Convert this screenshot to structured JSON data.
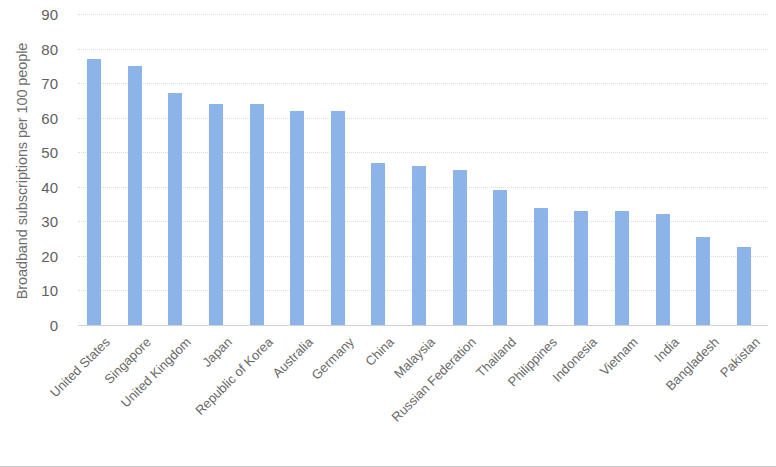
{
  "chart_data": {
    "type": "bar",
    "title": "",
    "subtitle": "",
    "xlabel": "",
    "ylabel": "Broadband subscriptions per 100 people",
    "ylim": [
      0,
      90
    ],
    "ytick_step": 10,
    "yticks": [
      90,
      80,
      70,
      60,
      50,
      40,
      30,
      20,
      10,
      0
    ],
    "grid": true,
    "legend": "none",
    "bar_color": "#8cb4e8",
    "categories": [
      "United States",
      "Singapore",
      "United Kingdom",
      "Japan",
      "Republic of Korea",
      "Australia",
      "Germany",
      "China",
      "Malaysia",
      "Russian Federation",
      "Thailand",
      "Philippines",
      "Indonesia",
      "Vietnam",
      "India",
      "Bangladesh",
      "Pakistan"
    ],
    "values": [
      77,
      75,
      67,
      64,
      64,
      62,
      62,
      47,
      46,
      45,
      39,
      34,
      33,
      33,
      32,
      25.5,
      22.5
    ]
  }
}
